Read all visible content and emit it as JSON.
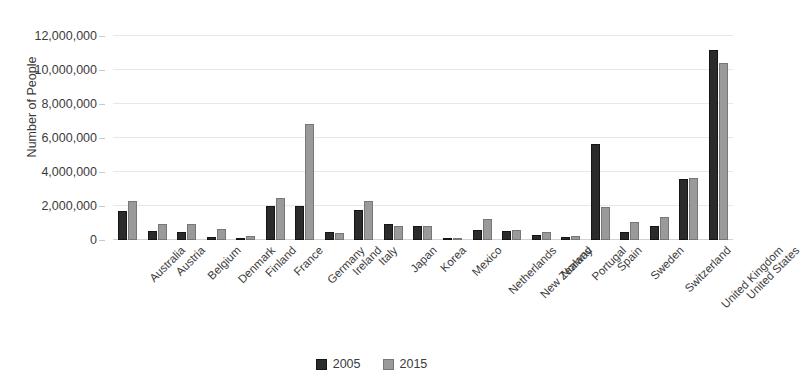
{
  "chart_data": {
    "type": "bar",
    "title": "",
    "xlabel": "",
    "ylabel": "Number of People",
    "ylim": [
      0,
      12000000
    ],
    "ytick_values": [
      0,
      2000000,
      4000000,
      6000000,
      8000000,
      10000000,
      12000000
    ],
    "ytick_labels": [
      "0",
      "2,000,000",
      "4,000,000",
      "6,000,000",
      "8,000,000",
      "10,000,000",
      "12,000,000"
    ],
    "grid": true,
    "legend_position": "bottom",
    "categories": [
      "Australia",
      "Austria",
      "Belgium",
      "Denmark",
      "Finland",
      "France",
      "Germany",
      "Ireland",
      "Italy",
      "Japan",
      "Korea",
      "Mexico",
      "Netherlands",
      "New Zealand",
      "Norway",
      "Portugal",
      "Spain",
      "Sweden",
      "Switzerland",
      "United Kingdom",
      "United States"
    ],
    "series": [
      {
        "name": "2005",
        "color": "#2b2b2b",
        "values": [
          1700000,
          550000,
          450000,
          160000,
          100000,
          2000000,
          2000000,
          500000,
          1750000,
          950000,
          850000,
          60000,
          600000,
          550000,
          300000,
          150000,
          5650000,
          480000,
          800000,
          3600000,
          11200000
        ]
      },
      {
        "name": "2015",
        "color": "#9a9a9a",
        "values": [
          2300000,
          950000,
          950000,
          650000,
          250000,
          2500000,
          6800000,
          400000,
          2300000,
          850000,
          800000,
          120000,
          1250000,
          600000,
          450000,
          250000,
          1950000,
          1050000,
          1350000,
          3650000,
          10400000
        ]
      }
    ]
  },
  "legend": {
    "items": [
      {
        "label": "2005"
      },
      {
        "label": "2015"
      }
    ]
  }
}
